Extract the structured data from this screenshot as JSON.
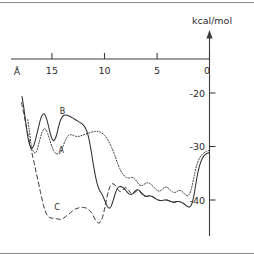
{
  "chart_data": {
    "type": "line",
    "title": "",
    "subtitle": "",
    "xlabel": "Å",
    "ylabel": "kcal/mol",
    "x_axis": {
      "ticks": [
        15,
        10,
        5,
        0
      ],
      "tick_labels": [
        "15",
        "10",
        "5",
        "0"
      ],
      "range": [
        18.6,
        -0.6
      ],
      "direction": "reversed",
      "unit": "Å",
      "position": "top"
    },
    "y_axis": {
      "ticks": [
        0,
        -20,
        -30,
        -40
      ],
      "tick_labels": [
        "0",
        "-20",
        "-30",
        "-40"
      ],
      "range": [
        -44.5,
        2.0
      ],
      "unit": "kcal/mol",
      "position": "right",
      "arrow": "up"
    },
    "grid": false,
    "legend": "inline-labels",
    "annotations": [
      {
        "text": "A",
        "x": 14.1,
        "y": -31.2,
        "name": "curve-label-a"
      },
      {
        "text": "B",
        "x": 14.0,
        "y": -24.0,
        "name": "curve-label-b"
      },
      {
        "text": "C",
        "x": 14.5,
        "y": -41.8,
        "name": "curve-label-c"
      }
    ],
    "series": [
      {
        "name": "A",
        "style": "dotted",
        "points": [
          [
            17.3,
            -25.0
          ],
          [
            17.15,
            -27.0
          ],
          [
            17.0,
            -29.4
          ],
          [
            16.85,
            -30.6
          ],
          [
            16.7,
            -31.1
          ],
          [
            16.55,
            -31.2
          ],
          [
            16.4,
            -30.6
          ],
          [
            16.2,
            -29.1
          ],
          [
            16.0,
            -27.7
          ],
          [
            15.85,
            -27.0
          ],
          [
            15.7,
            -26.7
          ],
          [
            15.55,
            -26.9
          ],
          [
            15.4,
            -27.6
          ],
          [
            15.2,
            -28.8
          ],
          [
            15.0,
            -30.0
          ],
          [
            14.8,
            -30.9
          ],
          [
            14.6,
            -31.3
          ],
          [
            14.4,
            -31.4
          ],
          [
            14.2,
            -31.2
          ],
          [
            14.0,
            -30.3
          ],
          [
            13.8,
            -29.2
          ],
          [
            13.6,
            -28.4
          ],
          [
            13.4,
            -27.9
          ],
          [
            13.2,
            -27.8
          ],
          [
            13.0,
            -27.9
          ],
          [
            12.7,
            -28.1
          ],
          [
            12.4,
            -28.1
          ],
          [
            12.1,
            -27.9
          ],
          [
            11.8,
            -27.7
          ],
          [
            11.5,
            -27.5
          ],
          [
            11.2,
            -27.3
          ],
          [
            10.9,
            -27.2
          ],
          [
            10.6,
            -27.2
          ],
          [
            10.3,
            -27.4
          ],
          [
            10.0,
            -27.9
          ],
          [
            9.7,
            -28.7
          ],
          [
            9.4,
            -29.8
          ],
          [
            9.1,
            -31.2
          ],
          [
            8.9,
            -32.3
          ],
          [
            8.7,
            -33.4
          ],
          [
            8.5,
            -34.3
          ],
          [
            8.3,
            -35.0
          ],
          [
            8.1,
            -35.5
          ],
          [
            7.9,
            -35.8
          ],
          [
            7.7,
            -35.9
          ],
          [
            7.5,
            -35.8
          ],
          [
            7.3,
            -35.8
          ],
          [
            7.1,
            -36.1
          ],
          [
            6.9,
            -36.6
          ],
          [
            6.7,
            -37.1
          ],
          [
            6.5,
            -37.3
          ],
          [
            6.3,
            -37.2
          ],
          [
            6.1,
            -36.9
          ],
          [
            5.9,
            -36.8
          ],
          [
            5.7,
            -36.9
          ],
          [
            5.5,
            -37.2
          ],
          [
            5.3,
            -37.6
          ],
          [
            5.1,
            -38.0
          ],
          [
            4.9,
            -38.3
          ],
          [
            4.7,
            -38.3
          ],
          [
            4.5,
            -38.0
          ],
          [
            4.3,
            -37.7
          ],
          [
            4.1,
            -37.6
          ],
          [
            3.9,
            -37.8
          ],
          [
            3.7,
            -38.2
          ],
          [
            3.5,
            -38.5
          ],
          [
            3.3,
            -38.6
          ],
          [
            3.1,
            -38.4
          ],
          [
            2.9,
            -38.2
          ],
          [
            2.7,
            -38.3
          ],
          [
            2.5,
            -38.6
          ],
          [
            2.3,
            -39.0
          ],
          [
            2.1,
            -39.2
          ],
          [
            1.95,
            -39.0
          ],
          [
            1.8,
            -38.4
          ],
          [
            1.65,
            -37.3
          ],
          [
            1.5,
            -35.9
          ],
          [
            1.35,
            -34.5
          ],
          [
            1.2,
            -33.4
          ],
          [
            1.05,
            -32.6
          ],
          [
            0.9,
            -32.0
          ],
          [
            0.75,
            -31.6
          ],
          [
            0.6,
            -31.3
          ],
          [
            0.45,
            -31.1
          ],
          [
            0.3,
            -30.9
          ],
          [
            0.15,
            -30.8
          ],
          [
            0.0,
            -30.7
          ]
        ]
      },
      {
        "name": "B",
        "style": "solid",
        "points": [
          [
            17.85,
            -20.6
          ],
          [
            17.7,
            -22.4
          ],
          [
            17.55,
            -24.6
          ],
          [
            17.4,
            -26.8
          ],
          [
            17.25,
            -28.6
          ],
          [
            17.1,
            -29.8
          ],
          [
            16.95,
            -30.3
          ],
          [
            16.8,
            -30.1
          ],
          [
            16.6,
            -29.0
          ],
          [
            16.4,
            -27.4
          ],
          [
            16.2,
            -25.8
          ],
          [
            16.05,
            -24.7
          ],
          [
            15.9,
            -24.1
          ],
          [
            15.75,
            -23.9
          ],
          [
            15.6,
            -24.3
          ],
          [
            15.45,
            -25.2
          ],
          [
            15.3,
            -26.4
          ],
          [
            15.15,
            -27.6
          ],
          [
            15.0,
            -28.5
          ],
          [
            14.85,
            -28.9
          ],
          [
            14.7,
            -28.6
          ],
          [
            14.55,
            -27.8
          ],
          [
            14.4,
            -26.6
          ],
          [
            14.25,
            -25.5
          ],
          [
            14.1,
            -24.7
          ],
          [
            13.9,
            -24.2
          ],
          [
            13.7,
            -24.1
          ],
          [
            13.5,
            -24.2
          ],
          [
            13.25,
            -24.4
          ],
          [
            13.0,
            -24.7
          ],
          [
            12.75,
            -25.0
          ],
          [
            12.5,
            -25.3
          ],
          [
            12.25,
            -25.6
          ],
          [
            12.0,
            -26.0
          ],
          [
            11.8,
            -26.6
          ],
          [
            11.6,
            -27.6
          ],
          [
            11.45,
            -28.8
          ],
          [
            11.3,
            -30.4
          ],
          [
            11.15,
            -32.2
          ],
          [
            11.0,
            -34.0
          ],
          [
            10.85,
            -35.6
          ],
          [
            10.7,
            -36.9
          ],
          [
            10.55,
            -37.8
          ],
          [
            10.4,
            -38.4
          ],
          [
            10.25,
            -38.9
          ],
          [
            10.1,
            -39.5
          ],
          [
            9.95,
            -40.2
          ],
          [
            9.8,
            -40.9
          ],
          [
            9.65,
            -41.4
          ],
          [
            9.5,
            -41.5
          ],
          [
            9.35,
            -41.1
          ],
          [
            9.2,
            -40.3
          ],
          [
            9.05,
            -39.3
          ],
          [
            8.9,
            -38.4
          ],
          [
            8.75,
            -37.8
          ],
          [
            8.6,
            -37.5
          ],
          [
            8.45,
            -37.5
          ],
          [
            8.3,
            -37.6
          ],
          [
            8.1,
            -37.9
          ],
          [
            7.9,
            -38.4
          ],
          [
            7.7,
            -38.8
          ],
          [
            7.5,
            -39.0
          ],
          [
            7.3,
            -38.8
          ],
          [
            7.1,
            -38.4
          ],
          [
            6.9,
            -38.1
          ],
          [
            6.7,
            -38.2
          ],
          [
            6.5,
            -38.6
          ],
          [
            6.3,
            -39.0
          ],
          [
            6.1,
            -39.3
          ],
          [
            5.9,
            -39.3
          ],
          [
            5.7,
            -39.2
          ],
          [
            5.5,
            -39.3
          ],
          [
            5.3,
            -39.5
          ],
          [
            5.1,
            -39.8
          ],
          [
            4.9,
            -40.0
          ],
          [
            4.7,
            -40.1
          ],
          [
            4.5,
            -40.1
          ],
          [
            4.3,
            -40.0
          ],
          [
            4.1,
            -40.0
          ],
          [
            3.9,
            -40.1
          ],
          [
            3.7,
            -40.3
          ],
          [
            3.5,
            -40.4
          ],
          [
            3.3,
            -40.4
          ],
          [
            3.1,
            -40.3
          ],
          [
            2.9,
            -40.3
          ],
          [
            2.7,
            -40.4
          ],
          [
            2.5,
            -40.6
          ],
          [
            2.3,
            -40.9
          ],
          [
            2.1,
            -41.2
          ],
          [
            1.9,
            -41.3
          ],
          [
            1.75,
            -41.0
          ],
          [
            1.6,
            -40.2
          ],
          [
            1.45,
            -38.8
          ],
          [
            1.3,
            -37.0
          ],
          [
            1.15,
            -35.3
          ],
          [
            1.0,
            -34.0
          ],
          [
            0.85,
            -33.0
          ],
          [
            0.7,
            -32.3
          ],
          [
            0.55,
            -31.8
          ],
          [
            0.4,
            -31.5
          ],
          [
            0.25,
            -31.3
          ],
          [
            0.1,
            -31.2
          ],
          [
            0.0,
            -31.1
          ]
        ]
      },
      {
        "name": "C",
        "style": "dashed",
        "points": [
          [
            17.9,
            -21.8
          ],
          [
            17.7,
            -23.6
          ],
          [
            17.5,
            -25.6
          ],
          [
            17.3,
            -27.6
          ],
          [
            17.1,
            -29.4
          ],
          [
            16.9,
            -31.2
          ],
          [
            16.7,
            -33.0
          ],
          [
            16.5,
            -34.8
          ],
          [
            16.3,
            -36.6
          ],
          [
            16.1,
            -38.4
          ],
          [
            15.95,
            -39.8
          ],
          [
            15.8,
            -41.0
          ],
          [
            15.65,
            -42.0
          ],
          [
            15.5,
            -42.7
          ],
          [
            15.35,
            -43.1
          ],
          [
            15.2,
            -43.3
          ],
          [
            15.0,
            -43.4
          ],
          [
            14.8,
            -43.4
          ],
          [
            14.55,
            -43.5
          ],
          [
            14.3,
            -43.6
          ],
          [
            14.1,
            -43.6
          ],
          [
            13.9,
            -43.4
          ],
          [
            13.7,
            -43.1
          ],
          [
            13.5,
            -42.8
          ],
          [
            13.25,
            -42.4
          ],
          [
            13.0,
            -42.0
          ],
          [
            12.75,
            -41.7
          ],
          [
            12.5,
            -41.5
          ],
          [
            12.25,
            -41.4
          ],
          [
            12.0,
            -41.4
          ],
          [
            11.75,
            -41.5
          ],
          [
            11.5,
            -41.8
          ],
          [
            11.3,
            -42.2
          ],
          [
            11.1,
            -42.8
          ],
          [
            10.95,
            -43.4
          ],
          [
            10.8,
            -43.9
          ],
          [
            10.65,
            -44.2
          ],
          [
            10.5,
            -44.3
          ],
          [
            10.35,
            -44.0
          ],
          [
            10.2,
            -43.3
          ],
          [
            10.05,
            -42.2
          ],
          [
            9.9,
            -40.8
          ],
          [
            9.75,
            -39.4
          ],
          [
            9.6,
            -38.2
          ],
          [
            9.45,
            -37.4
          ],
          [
            9.3,
            -37.0
          ],
          [
            9.15,
            -37.0
          ],
          [
            9.0,
            -37.2
          ],
          [
            8.85,
            -37.6
          ],
          [
            8.7,
            -38.1
          ],
          [
            8.55,
            -38.4
          ],
          [
            8.4,
            -38.4
          ],
          [
            8.25,
            -38.1
          ],
          [
            8.1,
            -37.8
          ],
          [
            7.95,
            -37.7
          ],
          [
            7.8,
            -37.9
          ],
          [
            7.65,
            -38.3
          ],
          [
            7.5,
            -38.7
          ],
          [
            7.35,
            -38.9
          ],
          [
            7.2,
            -38.8
          ],
          [
            7.05,
            -38.5
          ],
          [
            6.9,
            -38.2
          ],
          [
            6.75,
            -38.2
          ],
          [
            6.6,
            -38.5
          ],
          [
            6.45,
            -38.9
          ],
          [
            6.3,
            -39.2
          ],
          [
            6.1,
            -39.3
          ],
          [
            5.9,
            -39.3
          ],
          [
            5.7,
            -39.2
          ],
          [
            5.5,
            -39.3
          ],
          [
            5.3,
            -39.5
          ],
          [
            5.1,
            -39.8
          ],
          [
            4.9,
            -40.0
          ],
          [
            4.7,
            -40.1
          ],
          [
            4.5,
            -40.1
          ],
          [
            4.3,
            -40.0
          ],
          [
            4.1,
            -40.0
          ],
          [
            3.9,
            -40.1
          ],
          [
            3.7,
            -40.3
          ],
          [
            3.5,
            -40.4
          ],
          [
            3.3,
            -40.4
          ],
          [
            3.1,
            -40.3
          ]
        ]
      }
    ]
  },
  "figure": {
    "x_unit_label": "Å",
    "y_unit_label": "kcal/mol",
    "x_tick_labels": [
      "15",
      "10",
      "5",
      "0"
    ],
    "y_tick_labels": [
      "0",
      "-20",
      "-30",
      "-40"
    ],
    "label_a": "A",
    "label_b": "B",
    "label_c": "C",
    "ink_color": "#303030",
    "axis_color": "#3c3c3c",
    "frame_color": "#8a8a8a",
    "background": "#ffffff"
  }
}
